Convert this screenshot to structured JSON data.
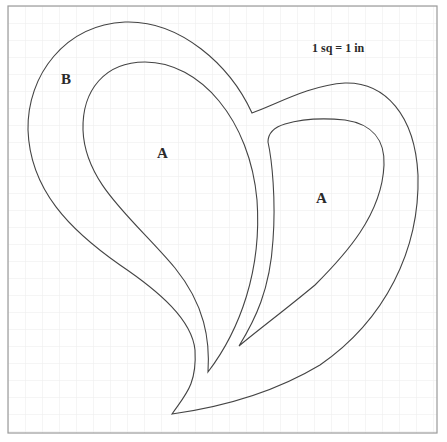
{
  "diagram": {
    "type": "pattern-template",
    "scale_note": "1 sq = 1 in",
    "grid": {
      "cell_px": 17,
      "line_color": "#ececec",
      "border_color": "#9a9a9a"
    },
    "stroke_color": "#444444",
    "pieces": [
      {
        "id": "B",
        "label": "B",
        "role": "outer heart outline"
      },
      {
        "id": "A1",
        "label": "A",
        "role": "inner left lobe"
      },
      {
        "id": "A2",
        "label": "A",
        "role": "inner right lobe"
      }
    ]
  }
}
